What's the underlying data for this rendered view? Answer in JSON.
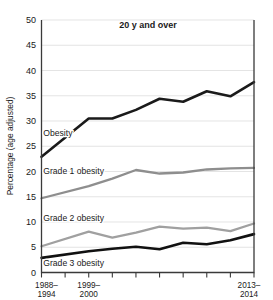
{
  "chart_data": {
    "type": "line",
    "title": "20 y and over",
    "xlabel": "",
    "ylabel": "Percentage (age adjusted)",
    "ylim": [
      0,
      50
    ],
    "ytick_labels": [
      "0",
      "5",
      "10",
      "15",
      "20",
      "25",
      "30",
      "35",
      "40",
      "45",
      "50"
    ],
    "ytick_values": [
      0,
      5,
      10,
      15,
      20,
      25,
      30,
      35,
      40,
      45,
      50
    ],
    "grid": true,
    "legend_position": "inline-labels",
    "x": [
      "1988-1994",
      "1999-2000",
      "2001-2002",
      "2003-2004",
      "2005-2006",
      "2007-2008",
      "2009-2010",
      "2011-2012",
      "2013-2014"
    ],
    "xtick_labels": [
      {
        "line1": "1988–",
        "line2": "1994"
      },
      {
        "line1": "",
        "line2": ""
      },
      {
        "line1": "1999–",
        "line2": "2000"
      },
      {
        "line1": "",
        "line2": ""
      },
      {
        "line1": "",
        "line2": ""
      },
      {
        "line1": "",
        "line2": ""
      },
      {
        "line1": "",
        "line2": ""
      },
      {
        "line1": "",
        "line2": ""
      },
      {
        "line1": "",
        "line2": ""
      },
      {
        "line1": "2013–",
        "line2": "2014"
      }
    ],
    "series": [
      {
        "name": "Obesity",
        "label": "Obesity",
        "color": "#1a1a1a",
        "width": 2.6,
        "values": [
          22.9,
          30.5,
          30.5,
          32.2,
          34.4,
          33.8,
          35.9,
          34.9,
          37.7
        ]
      },
      {
        "name": "Grade 1 obesity",
        "label": "Grade 1 obesity",
        "color": "#8e8e8e",
        "width": 2.3,
        "values": [
          14.7,
          17.1,
          18.6,
          20.3,
          19.6,
          19.8,
          20.4,
          20.6,
          20.7
        ]
      },
      {
        "name": "Grade 2 obesity",
        "label": "Grade 2 obesity",
        "color": "#a0a0a0",
        "width": 2.3,
        "values": [
          5.2,
          8.1,
          6.9,
          7.9,
          9.1,
          8.7,
          8.9,
          8.2,
          9.7
        ]
      },
      {
        "name": "Grade 3 obesity",
        "label": "Grade 3 obesity",
        "color": "#111111",
        "width": 2.6,
        "values": [
          2.9,
          4.2,
          4.7,
          5.1,
          4.6,
          5.9,
          5.6,
          6.4,
          7.6
        ]
      }
    ],
    "annotations": [
      {
        "text": "Obesity",
        "x": 0.18,
        "y": 27.0
      },
      {
        "text": "Grade 1 obesity",
        "x": 0.18,
        "y": 19.5
      },
      {
        "text": "Grade 2 obesity",
        "x": 0.18,
        "y": 10.2
      },
      {
        "text": "Grade 3 obesity",
        "x": 0.18,
        "y": 1.2
      }
    ],
    "colors": {
      "axis": "#3a3a3a",
      "grid": "#d8d8d8",
      "text": "#1a1a1a",
      "dark_series": "#1a1a1a",
      "light_series": "#8e8e8e",
      "background": "#ffffff"
    }
  }
}
